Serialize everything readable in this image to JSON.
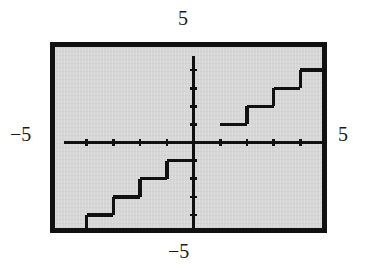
{
  "figure": {
    "kind": "graphing-calculator-plot"
  },
  "labels": {
    "top": "5",
    "bottom": "−5",
    "left": "−5",
    "right": "5"
  },
  "colors": {
    "frame": "#111111",
    "screen_background": "#d6d6d6",
    "axis": "#111111",
    "curve": "#111111",
    "page_background": "#ffffff",
    "label_text": "#1b1b1b"
  },
  "chart_data": {
    "type": "line",
    "title": "",
    "subtitle": "",
    "xlabel": "",
    "ylabel": "",
    "xlim": [
      -5,
      5
    ],
    "ylim": [
      -5,
      5
    ],
    "grid": false,
    "legend": null,
    "axis": {
      "x_ticks": [
        -4,
        -3,
        -2,
        -1,
        1,
        2,
        3,
        4
      ],
      "y_ticks": [
        -4,
        -3,
        -2,
        -1,
        1,
        2,
        3,
        4
      ],
      "x_tick_labels": [
        "",
        "",
        "",
        "",
        "",
        "",
        "",
        ""
      ],
      "y_tick_labels": [
        "",
        "",
        "",
        "",
        "",
        "",
        "",
        ""
      ],
      "tick_interval": 1,
      "x_axis_visible": true,
      "y_axis_visible": true
    },
    "annotations": [
      {
        "text": "5",
        "position": "above-window-top",
        "meaning": "y maximum"
      },
      {
        "text": "−5",
        "position": "below-window-bottom",
        "meaning": "y minimum"
      },
      {
        "text": "−5",
        "position": "left-of-window",
        "meaning": "x minimum"
      },
      {
        "text": "5",
        "position": "right-of-window",
        "meaning": "x maximum"
      }
    ],
    "series": [
      {
        "name": "y = floor(x)",
        "style": "step-post",
        "color": "#111111",
        "segments": [
          {
            "y": -5,
            "x_start": -5.0,
            "x_end": -4.0
          },
          {
            "y": -4,
            "x_start": -4.0,
            "x_end": -3.0
          },
          {
            "y": -3,
            "x_start": -3.0,
            "x_end": -2.0
          },
          {
            "y": -2,
            "x_start": -2.0,
            "x_end": -1.0
          },
          {
            "y": -1,
            "x_start": -1.0,
            "x_end": 0.0
          },
          {
            "y": 1,
            "x_start": 1.0,
            "x_end": 2.0
          },
          {
            "y": 2,
            "x_start": 2.0,
            "x_end": 3.0
          },
          {
            "y": 3,
            "x_start": 3.0,
            "x_end": 4.0
          },
          {
            "y": 4,
            "x_start": 4.0,
            "x_end": 5.0
          }
        ]
      }
    ]
  }
}
